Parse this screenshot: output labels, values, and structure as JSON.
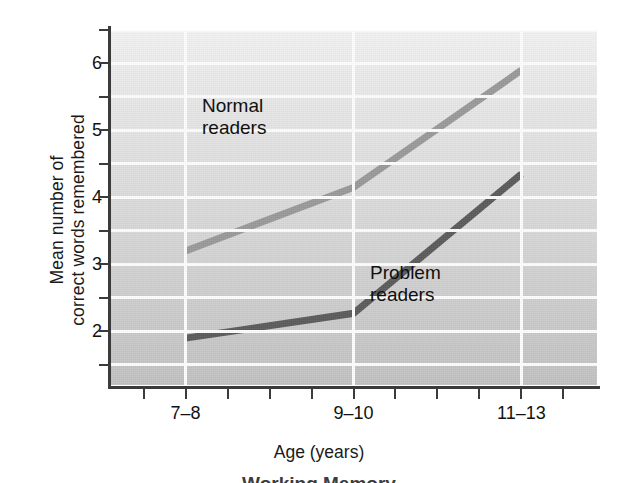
{
  "chart_data": {
    "type": "line",
    "title": "",
    "xlabel": "Age (years)",
    "ylabel": "Mean number of correct words remembered",
    "ylabel_lines": [
      "Mean number of",
      "correct words remembered"
    ],
    "categories": [
      "7–8",
      "9–10",
      "11–13"
    ],
    "x": [
      1,
      2,
      3
    ],
    "ylim": [
      1.2,
      6.5
    ],
    "xlim": [
      0.55,
      3.45
    ],
    "yticks": [
      2,
      3,
      4,
      5,
      6
    ],
    "ytick_labels": [
      "2",
      "3",
      "4",
      "5",
      "6"
    ],
    "yminor_ticks": [
      1.5,
      2.5,
      3.5,
      4.5,
      5.5,
      6.5
    ],
    "grid": true,
    "grid_color": "#fdfdfd",
    "plot_background": "#d9d9d9",
    "legend_position": "inline-annotations",
    "series": [
      {
        "name": "Normal readers",
        "label": "Normal\nreaders",
        "color": "#9a9a9a",
        "values": [
          3.2,
          4.15,
          5.9
        ]
      },
      {
        "name": "Problem readers",
        "label": "Problem\nreaders",
        "color": "#5c5c5c",
        "values": [
          1.9,
          2.27,
          4.35
        ]
      }
    ]
  },
  "caption_sliver": "Working Memory"
}
